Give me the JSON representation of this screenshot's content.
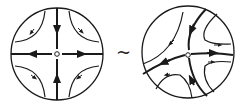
{
  "diagram": {
    "relation_symbol": "~",
    "left": {
      "name": "linear saddle",
      "center_label": "o",
      "separatrices": "horizontal and vertical axes",
      "flow": "incoming along vertical axis, outgoing along horizontal axis"
    },
    "right": {
      "name": "nonlinear saddle (curved separatrices)",
      "center_label": "o",
      "separatrices": "curved",
      "flow": "hyperbolic trajectories in four sectors"
    },
    "colors": {
      "stroke": "#1a1a1a",
      "background": "#ffffff"
    }
  }
}
